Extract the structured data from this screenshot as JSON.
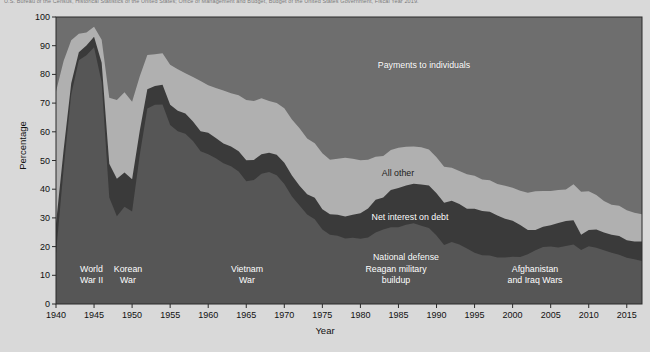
{
  "source_note": "U.S. Bureau of the Census, Historical Statistics of the United States; Office of Management and Budget, Budget of the United States Government, Fiscal Year 2019.",
  "axes": {
    "ylabel": "Percentage",
    "xlabel": "Year",
    "yticks": [
      "0",
      "10",
      "20",
      "30",
      "40",
      "50",
      "60",
      "70",
      "80",
      "90",
      "100"
    ],
    "xticks": [
      "1940",
      "1945",
      "1950",
      "1955",
      "1960",
      "1965",
      "1970",
      "1975",
      "1980",
      "1985",
      "1990",
      "1995",
      "2000",
      "2005",
      "2010",
      "2015"
    ]
  },
  "band_labels": [
    {
      "key": "payments",
      "text": "Payments to individuals"
    },
    {
      "key": "allother",
      "text": "All other"
    },
    {
      "key": "interest",
      "text": "Net interest on debt"
    },
    {
      "key": "defense",
      "text": "National defense"
    }
  ],
  "era_labels": [
    {
      "key": "wwii",
      "text": "World\nWar II"
    },
    {
      "key": "korea",
      "text": "Korean\nWar"
    },
    {
      "key": "vietnam",
      "text": "Vietnam\nWar"
    },
    {
      "key": "reagan",
      "text": "Reagan military\nbuildup"
    },
    {
      "key": "afghaniraq",
      "text": "Afghanistan\nand Iraq Wars"
    }
  ],
  "colors": {
    "page_background": "#d9d9d9",
    "plot_background": "#6e6e6e",
    "national_defense": "#565656",
    "net_interest_on_debt": "#3a3a3a",
    "all_other": "#b0b0b0",
    "payments_to_individuals": "#6e6e6e",
    "axis_text": "#111111",
    "label_text": "#ffffff"
  },
  "chart_data": {
    "type": "area",
    "title": "",
    "xlabel": "Year",
    "ylabel": "Percentage",
    "xlim": [
      1940,
      2017
    ],
    "ylim": [
      0,
      100
    ],
    "grid": false,
    "legend": "inline annotations",
    "stacked": true,
    "stack_order_bottom_to_top": [
      "National defense",
      "Net interest on debt",
      "All other",
      "Payments to individuals"
    ],
    "x": [
      1940,
      1941,
      1942,
      1943,
      1944,
      1945,
      1946,
      1947,
      1948,
      1949,
      1950,
      1951,
      1952,
      1953,
      1954,
      1955,
      1956,
      1957,
      1958,
      1959,
      1960,
      1961,
      1962,
      1963,
      1964,
      1965,
      1966,
      1967,
      1968,
      1969,
      1970,
      1971,
      1972,
      1973,
      1974,
      1975,
      1976,
      1977,
      1978,
      1979,
      1980,
      1981,
      1982,
      1983,
      1984,
      1985,
      1986,
      1987,
      1988,
      1989,
      1990,
      1991,
      1992,
      1993,
      1994,
      1995,
      1996,
      1997,
      1998,
      1999,
      2000,
      2001,
      2002,
      2003,
      2004,
      2005,
      2006,
      2007,
      2008,
      2009,
      2010,
      2011,
      2012,
      2013,
      2014,
      2015,
      2016,
      2017
    ],
    "series": [
      {
        "name": "National defense",
        "color": "#565656",
        "values": [
          17.5,
          47.1,
          73.0,
          84.9,
          86.7,
          89.5,
          77.3,
          37.1,
          30.6,
          33.9,
          32.2,
          51.8,
          68.1,
          69.4,
          69.5,
          62.4,
          60.2,
          59.3,
          56.8,
          53.2,
          52.2,
          50.8,
          49.0,
          48.0,
          46.2,
          42.8,
          43.2,
          45.4,
          46.0,
          44.9,
          41.8,
          37.5,
          34.3,
          31.2,
          29.5,
          26.0,
          24.1,
          23.8,
          22.8,
          23.1,
          22.7,
          23.2,
          24.9,
          26.0,
          26.7,
          26.7,
          27.6,
          28.1,
          27.3,
          26.5,
          23.9,
          20.6,
          21.6,
          20.7,
          19.3,
          17.9,
          17.0,
          16.9,
          16.2,
          16.2,
          16.5,
          16.4,
          17.3,
          18.7,
          19.9,
          20.0,
          19.7,
          20.2,
          20.7,
          18.8,
          20.1,
          19.6,
          18.7,
          17.9,
          17.2,
          16.1,
          15.6,
          15.0
        ]
      },
      {
        "name": "Net interest on debt",
        "color": "#3a3a3a",
        "values": [
          10.5,
          6.6,
          3.9,
          2.8,
          3.4,
          3.6,
          6.8,
          11.8,
          13.0,
          11.9,
          11.3,
          8.5,
          6.7,
          6.6,
          6.9,
          7.0,
          7.1,
          7.1,
          6.8,
          7.0,
          7.5,
          7.0,
          6.9,
          6.9,
          7.0,
          7.3,
          7.0,
          6.8,
          6.7,
          7.1,
          7.4,
          7.3,
          6.9,
          7.0,
          7.5,
          7.0,
          7.2,
          7.3,
          7.7,
          8.0,
          8.9,
          10.1,
          11.4,
          11.1,
          13.0,
          13.7,
          13.7,
          13.8,
          14.3,
          14.8,
          14.7,
          14.7,
          14.4,
          14.1,
          13.9,
          15.3,
          15.4,
          15.2,
          14.6,
          13.5,
          12.5,
          11.1,
          8.5,
          7.1,
          7.0,
          7.4,
          8.5,
          8.7,
          8.5,
          5.3,
          5.7,
          6.4,
          6.2,
          6.2,
          6.5,
          6.1,
          6.2,
          6.8
        ]
      },
      {
        "name": "All other",
        "color": "#b0b0b0",
        "values": [
          46.0,
          31.0,
          15.0,
          6.5,
          4.5,
          3.5,
          8.0,
          23.0,
          27.5,
          28.0,
          27.0,
          19.0,
          12.0,
          11.0,
          11.0,
          14.0,
          14.5,
          14.0,
          15.5,
          17.5,
          16.5,
          17.5,
          18.5,
          18.5,
          19.5,
          21.0,
          20.5,
          19.5,
          18.0,
          18.0,
          19.0,
          19.5,
          20.0,
          19.5,
          19.0,
          19.5,
          19.0,
          19.5,
          20.5,
          19.5,
          18.5,
          17.0,
          15.0,
          14.5,
          14.0,
          14.0,
          13.5,
          13.0,
          13.0,
          12.5,
          12.5,
          12.5,
          11.5,
          11.5,
          12.0,
          11.5,
          11.0,
          11.0,
          11.0,
          11.5,
          11.5,
          12.0,
          13.0,
          13.5,
          12.5,
          12.0,
          11.5,
          11.0,
          12.5,
          15.0,
          13.5,
          12.0,
          11.0,
          10.5,
          10.5,
          10.5,
          10.0,
          9.5
        ]
      },
      {
        "name": "Payments to individuals",
        "color": "#6e6e6e",
        "values": [
          26.0,
          15.3,
          8.1,
          5.8,
          5.4,
          3.4,
          7.9,
          28.1,
          28.9,
          26.2,
          29.5,
          20.7,
          13.2,
          13.0,
          12.6,
          16.6,
          18.2,
          19.6,
          20.9,
          22.3,
          23.8,
          24.7,
          25.6,
          26.6,
          27.3,
          28.9,
          29.3,
          28.3,
          29.3,
          30.0,
          31.8,
          35.7,
          38.8,
          42.3,
          44.0,
          47.5,
          49.7,
          49.4,
          49.0,
          49.4,
          49.9,
          49.7,
          48.7,
          48.4,
          46.3,
          45.6,
          45.2,
          45.1,
          45.4,
          46.2,
          48.9,
          52.2,
          52.5,
          53.7,
          54.8,
          55.3,
          56.6,
          56.9,
          58.2,
          58.8,
          59.5,
          60.5,
          61.2,
          60.7,
          60.6,
          60.6,
          60.3,
          60.1,
          58.3,
          60.9,
          60.7,
          62.0,
          64.1,
          65.4,
          65.8,
          67.3,
          68.2,
          68.7
        ]
      }
    ],
    "annotations": [
      {
        "text": "World War II",
        "x_range": [
          1941,
          1945
        ]
      },
      {
        "text": "Korean War",
        "x_range": [
          1950,
          1953
        ]
      },
      {
        "text": "Vietnam War",
        "x_range": [
          1964,
          1973
        ]
      },
      {
        "text": "Reagan military buildup",
        "x_range": [
          1981,
          1989
        ]
      },
      {
        "text": "Afghanistan and Iraq Wars",
        "x_range": [
          2001,
          2014
        ]
      }
    ]
  }
}
